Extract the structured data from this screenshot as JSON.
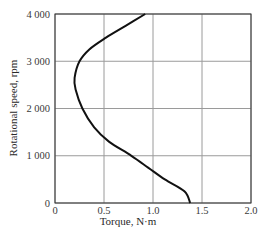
{
  "chart_data": {
    "type": "line",
    "title": "",
    "xlabel": "Torque, N·m",
    "ylabel": "Rotational speed, rpm",
    "xlim": [
      0,
      2.0
    ],
    "ylim": [
      0,
      4000
    ],
    "x_ticks": [
      "0",
      "0.5",
      "1.0",
      "1.5",
      "2.0"
    ],
    "y_ticks": [
      "0",
      "1 000",
      "2 000",
      "3 000",
      "4 000"
    ],
    "grid": true,
    "legend": null,
    "series": [
      {
        "name": "Torque-speed curve",
        "points": [
          {
            "x": 1.38,
            "y": 0
          },
          {
            "x": 1.32,
            "y": 250
          },
          {
            "x": 1.12,
            "y": 500
          },
          {
            "x": 0.95,
            "y": 750
          },
          {
            "x": 0.78,
            "y": 1000
          },
          {
            "x": 0.55,
            "y": 1300
          },
          {
            "x": 0.4,
            "y": 1600
          },
          {
            "x": 0.28,
            "y": 2000
          },
          {
            "x": 0.21,
            "y": 2400
          },
          {
            "x": 0.2,
            "y": 2650
          },
          {
            "x": 0.25,
            "y": 3000
          },
          {
            "x": 0.35,
            "y": 3250
          },
          {
            "x": 0.52,
            "y": 3500
          },
          {
            "x": 0.72,
            "y": 3750
          },
          {
            "x": 0.92,
            "y": 4000
          }
        ]
      }
    ]
  },
  "labels": {
    "xlabel": "Torque, N·m",
    "ylabel": "Rotational speed, rpm",
    "x_ticks": [
      "0",
      "0.5",
      "1.0",
      "1.5",
      "2.0"
    ],
    "y_ticks": [
      "0",
      "1 000",
      "2 000",
      "3 000",
      "4 000"
    ]
  },
  "colors": {
    "curve": "#111111",
    "grid": "#9a9a9a",
    "axis": "#333333"
  }
}
